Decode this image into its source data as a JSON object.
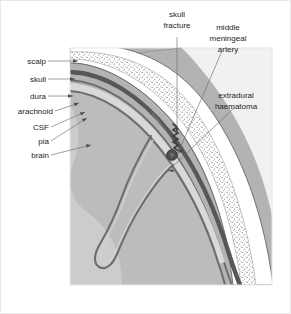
{
  "figure": {
    "title": "Extradural haematoma",
    "frame_color": "#e9e9e9",
    "background": "#ffffff"
  },
  "panel": {
    "x": 70,
    "y": 48,
    "width": 202,
    "height": 237,
    "background": "#f2f2f2"
  },
  "labels": {
    "scalp": "scalp",
    "skull": "skull",
    "dura": "dura",
    "arachnoid": "arachnoid",
    "csf": "CSF",
    "pia": "pia",
    "brain": "brain",
    "skull_fracture_line1": "skull",
    "skull_fracture_line2": "fracture",
    "mma_line1": "middle",
    "mma_line2": "meningeal",
    "mma_line3": "artery",
    "haematoma_line1": "extradural",
    "haematoma_line2": "haematoma"
  },
  "colors": {
    "scalp": "#b3b3b3",
    "skull_outer_table": "#ffffff",
    "skull_diploe_stipple": "#7a7a7a",
    "dura": "#595959",
    "arachnoid": "#6b6b6b",
    "csf": "#d8d8d8",
    "pia": "#6b6b6b",
    "brain": "#b9b9b9",
    "brain_light": "#c9c9c9",
    "haematoma": "#b3b3b3",
    "artery": "#4a4a4a",
    "fracture": "#3d3d3d",
    "outline": "#4a4a4a",
    "leader": "#6d6d6d",
    "text": "#231f20"
  },
  "anatomy": {
    "layer_order": [
      "scalp",
      "skull",
      "extradural haematoma",
      "dura",
      "arachnoid",
      "CSF",
      "pia",
      "brain"
    ],
    "features": [
      "skull fracture",
      "middle meningeal artery",
      "extradural haematoma",
      "cerebral sulcus"
    ]
  }
}
